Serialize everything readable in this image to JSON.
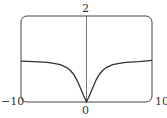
{
  "chart_data": {
    "type": "line",
    "title": "",
    "xlabel": "",
    "ylabel": "",
    "xlim": [
      -10,
      10
    ],
    "ylim": [
      0,
      2
    ],
    "grid": false,
    "x_tick_labels": [
      "-10",
      "0",
      "10"
    ],
    "y_tick_labels": [
      "2"
    ],
    "series": [
      {
        "name": "f(x)",
        "x": [
          -10,
          -8,
          -6,
          -5,
          -4,
          -3,
          -2.5,
          -2,
          -1.5,
          -1,
          -0.5,
          0,
          0.5,
          1,
          1.5,
          2,
          2.5,
          3,
          4,
          5,
          6,
          8,
          10
        ],
        "y": [
          0.95,
          0.94,
          0.92,
          0.9,
          0.87,
          0.8,
          0.74,
          0.65,
          0.52,
          0.35,
          0.17,
          0,
          0.17,
          0.35,
          0.52,
          0.65,
          0.74,
          0.8,
          0.87,
          0.9,
          0.92,
          0.94,
          0.97
        ]
      }
    ]
  },
  "labels": {
    "x_min": "−10",
    "x_max": "10",
    "x_origin": "0",
    "y_max": "2"
  },
  "colors": {
    "frame": "#444444",
    "curve": "#333333",
    "axis": "#555555"
  }
}
